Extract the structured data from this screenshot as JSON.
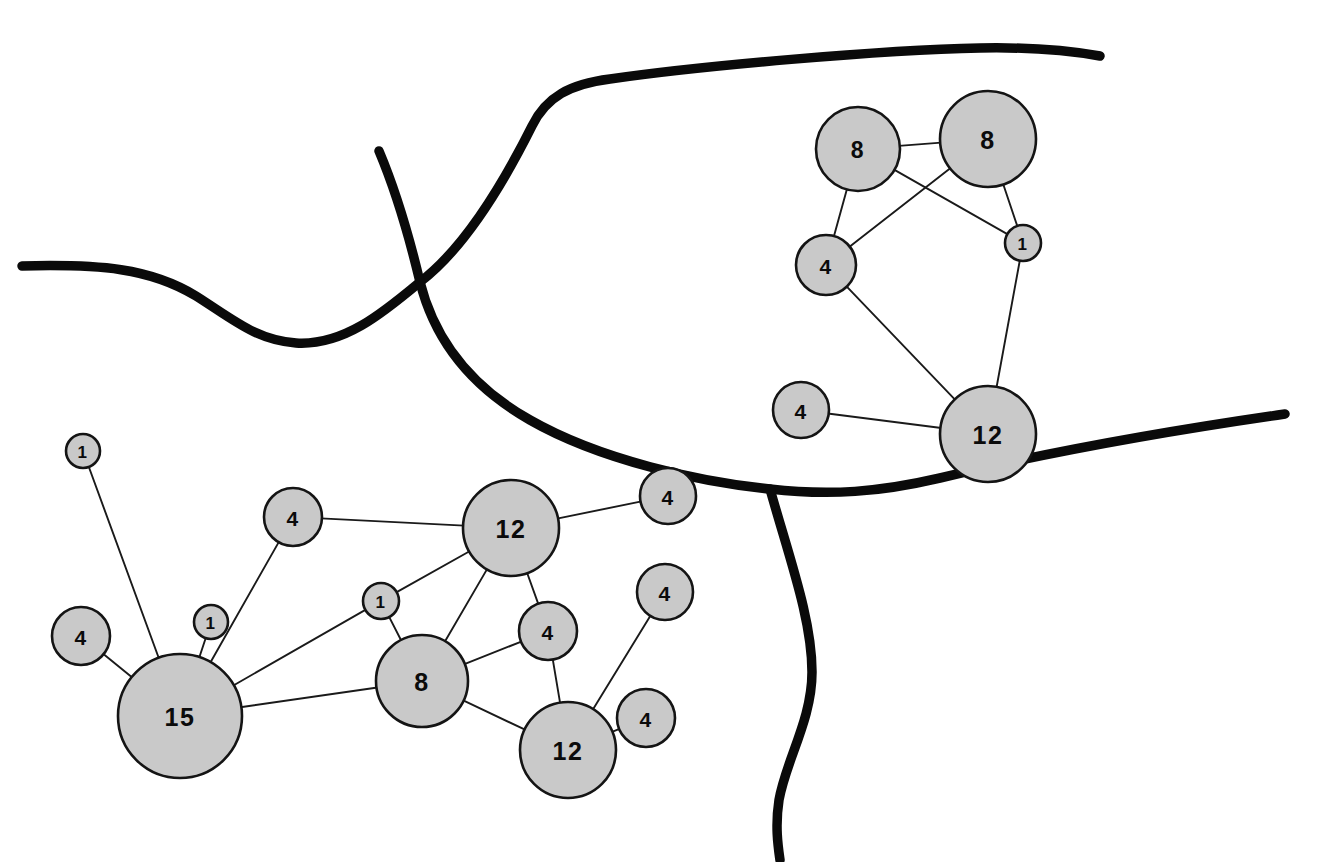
{
  "figure": {
    "type": "node-link-diagram",
    "background_color": "#ffffff",
    "node_fill_color": "#c9c9c9",
    "node_stroke_color": "#141414",
    "edge_color": "#1a1a1a",
    "boundary_color": "#0a0a0a"
  },
  "clusters": [
    {
      "id": "cluster-upper-right",
      "name": "upper-right-cluster",
      "nodes": [
        {
          "id": "ur-8a",
          "label": "8",
          "value": 8,
          "cx": 858,
          "cy": 149,
          "r": 42
        },
        {
          "id": "ur-8b",
          "label": "8",
          "value": 8,
          "cx": 988,
          "cy": 139,
          "r": 48
        },
        {
          "id": "ur-4a",
          "label": "4",
          "value": 4,
          "cx": 826,
          "cy": 265,
          "r": 30
        },
        {
          "id": "ur-1",
          "label": "1",
          "value": 1,
          "cx": 1023,
          "cy": 243,
          "r": 18
        },
        {
          "id": "ur-4b",
          "label": "4",
          "value": 4,
          "cx": 801,
          "cy": 410,
          "r": 28
        },
        {
          "id": "ur-12",
          "label": "12",
          "value": 12,
          "cx": 988,
          "cy": 434,
          "r": 48
        }
      ],
      "edges": [
        {
          "from": "ur-8a",
          "to": "ur-8b"
        },
        {
          "from": "ur-8a",
          "to": "ur-4a"
        },
        {
          "from": "ur-8a",
          "to": "ur-1"
        },
        {
          "from": "ur-8b",
          "to": "ur-4a"
        },
        {
          "from": "ur-8b",
          "to": "ur-1"
        },
        {
          "from": "ur-4a",
          "to": "ur-12"
        },
        {
          "from": "ur-1",
          "to": "ur-12"
        },
        {
          "from": "ur-4b",
          "to": "ur-12"
        }
      ]
    },
    {
      "id": "cluster-lower-left",
      "name": "lower-left-cluster",
      "nodes": [
        {
          "id": "ll-1a",
          "label": "1",
          "value": 1,
          "cx": 83,
          "cy": 451,
          "r": 17
        },
        {
          "id": "ll-4a",
          "label": "4",
          "value": 4,
          "cx": 293,
          "cy": 517,
          "r": 29
        },
        {
          "id": "ll-12a",
          "label": "12",
          "value": 12,
          "cx": 511,
          "cy": 528,
          "r": 48
        },
        {
          "id": "ll-4b",
          "label": "4",
          "value": 4,
          "cx": 668,
          "cy": 496,
          "r": 28
        },
        {
          "id": "ll-4c",
          "label": "4",
          "value": 4,
          "cx": 81,
          "cy": 636,
          "r": 29
        },
        {
          "id": "ll-1b",
          "label": "1",
          "value": 1,
          "cx": 211,
          "cy": 622,
          "r": 17
        },
        {
          "id": "ll-1c",
          "label": "1",
          "value": 1,
          "cx": 381,
          "cy": 601,
          "r": 18
        },
        {
          "id": "ll-4d",
          "label": "4",
          "value": 4,
          "cx": 665,
          "cy": 592,
          "r": 28
        },
        {
          "id": "ll-15",
          "label": "15",
          "value": 15,
          "cx": 180,
          "cy": 716,
          "r": 62
        },
        {
          "id": "ll-8",
          "label": "8",
          "value": 8,
          "cx": 422,
          "cy": 681,
          "r": 46
        },
        {
          "id": "ll-4e",
          "label": "4",
          "value": 4,
          "cx": 548,
          "cy": 631,
          "r": 29
        },
        {
          "id": "ll-12b",
          "label": "12",
          "value": 12,
          "cx": 568,
          "cy": 750,
          "r": 48
        },
        {
          "id": "ll-4f",
          "label": "4",
          "value": 4,
          "cx": 646,
          "cy": 718,
          "r": 29
        }
      ],
      "edges": [
        {
          "from": "ll-1a",
          "to": "ll-15"
        },
        {
          "from": "ll-4c",
          "to": "ll-15"
        },
        {
          "from": "ll-1b",
          "to": "ll-15"
        },
        {
          "from": "ll-15",
          "to": "ll-4a"
        },
        {
          "from": "ll-15",
          "to": "ll-1c"
        },
        {
          "from": "ll-15",
          "to": "ll-8"
        },
        {
          "from": "ll-4a",
          "to": "ll-12a"
        },
        {
          "from": "ll-12a",
          "to": "ll-1c"
        },
        {
          "from": "ll-12a",
          "to": "ll-4b"
        },
        {
          "from": "ll-12a",
          "to": "ll-8"
        },
        {
          "from": "ll-12a",
          "to": "ll-4e"
        },
        {
          "from": "ll-1c",
          "to": "ll-8"
        },
        {
          "from": "ll-8",
          "to": "ll-4e"
        },
        {
          "from": "ll-8",
          "to": "ll-12b"
        },
        {
          "from": "ll-4e",
          "to": "ll-12b"
        },
        {
          "from": "ll-4d",
          "to": "ll-12b"
        },
        {
          "from": "ll-12b",
          "to": "ll-4f"
        }
      ]
    }
  ],
  "boundaries": [
    {
      "id": "boundary-west",
      "name": "west-boundary-curve",
      "path": "M 22 266 C 100 264, 150 268, 196 296 C 234 320, 256 340, 296 343 C 344 346, 384 312, 420 282"
    },
    {
      "id": "boundary-north",
      "name": "north-boundary-curve",
      "path": "M 420 282 C 462 250, 500 190, 532 126 C 546 97, 570 84, 610 79 C 700 66, 880 50, 980 48 C 1030 47, 1066 50, 1100 56"
    },
    {
      "id": "boundary-south",
      "name": "south-east-boundary-curve",
      "path": "M 379 151 C 398 196, 410 240, 420 282 C 434 338, 470 386, 530 420 C 600 460, 700 482, 770 489 C 830 496, 880 492, 940 478 C 1040 454, 1160 432, 1285 414"
    },
    {
      "id": "boundary-descending",
      "name": "south-descending-boundary-curve",
      "path": "M 770 489 C 790 560, 812 620, 812 672 C 812 720, 786 760, 779 800 C 775 826, 778 846, 780 860"
    }
  ]
}
